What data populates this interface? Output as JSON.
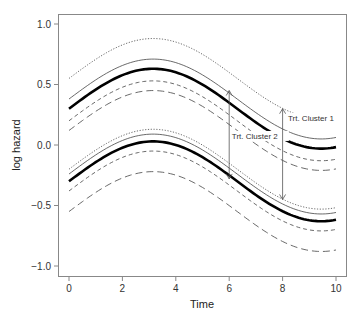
{
  "chart_data": {
    "type": "line",
    "title": "",
    "xlabel": "Time",
    "ylabel": "log hazard",
    "xlim": [
      -0.4,
      10.4
    ],
    "ylim": [
      -1.08,
      1.08
    ],
    "xticks": [
      0,
      2,
      4,
      6,
      8,
      10
    ],
    "yticks": [
      1.0,
      0.5,
      0.0,
      -0.5,
      -1.0
    ],
    "ytick_labels": [
      "1.0",
      "0.5",
      "0.0",
      "−0.5",
      "−1.0"
    ],
    "grid": false,
    "legend": null,
    "curve_model": "y = offset + 0.33*sin(pi*t/6.3)",
    "series": [
      {
        "name": "Cluster 1 upper dotted",
        "style": "dotted",
        "width": 0.8,
        "offset": 0.55
      },
      {
        "name": "Cluster 1 upper thin",
        "style": "solid",
        "width": 0.8,
        "offset": 0.38
      },
      {
        "name": "Cluster 1 fitted",
        "style": "solid",
        "width": 2.6,
        "offset": 0.3
      },
      {
        "name": "Cluster 1 lower dashed",
        "style": "dashed-short",
        "width": 0.8,
        "offset": 0.2
      },
      {
        "name": "Cluster 1 lower longdash",
        "style": "dashed-long",
        "width": 0.8,
        "offset": 0.12
      },
      {
        "name": "Cluster 2 upper dotted",
        "style": "dotted",
        "width": 0.8,
        "offset": -0.2
      },
      {
        "name": "Cluster 2 upper thin",
        "style": "solid",
        "width": 0.8,
        "offset": -0.24
      },
      {
        "name": "Cluster 2 fitted",
        "style": "solid",
        "width": 2.6,
        "offset": -0.3
      },
      {
        "name": "Cluster 2 lower dashed",
        "style": "dashed-short",
        "width": 0.8,
        "offset": -0.38
      },
      {
        "name": "Cluster 2 lower longdash",
        "style": "dashed-long",
        "width": 0.8,
        "offset": -0.55
      }
    ],
    "sample_values": {
      "x": [
        0,
        2,
        4,
        6,
        8,
        10
      ],
      "cluster1_fitted": [
        0.3,
        0.58,
        0.6,
        0.32,
        0.04,
        -0.03
      ],
      "cluster2_fitted": [
        -0.3,
        -0.02,
        0.0,
        -0.28,
        -0.56,
        -0.63
      ]
    },
    "annotations": [
      {
        "text": "Trt. Cluster 2",
        "arrow_x": 6,
        "arrow_y_from": -0.28,
        "arrow_y_to": 0.45,
        "text_pos": [
          6.1,
          0.05
        ]
      },
      {
        "text": "Trt. Cluster 1",
        "arrow_x": 8,
        "arrow_y_from": -0.45,
        "arrow_y_to": 0.3,
        "text_pos": [
          8.2,
          0.2
        ]
      }
    ]
  }
}
